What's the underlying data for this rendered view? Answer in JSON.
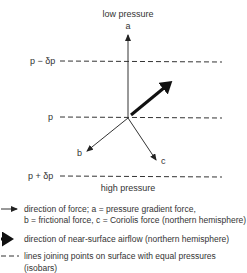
{
  "diagram": {
    "top_label": "low pressure",
    "bottom_label": "high pressure",
    "isobars": [
      {
        "label": "p − δp",
        "y": 61
      },
      {
        "label": "p",
        "y": 117
      },
      {
        "label": "p + δp",
        "y": 176
      }
    ],
    "forces": {
      "a": {
        "label": "a",
        "name": "pressure gradient force"
      },
      "b": {
        "label": "b",
        "name": "frictional force"
      },
      "c": {
        "label": "c",
        "name": "Coriolis force (northern hemisphere)"
      }
    },
    "airflow": {
      "name": "near-surface airflow (northern hemisphere)"
    },
    "colors": {
      "line": "#222222",
      "background": "#ffffff"
    }
  },
  "legend": {
    "force_line1": "direction of force; a = pressure gradient force,",
    "force_line2": "b = frictional force, c = Coriolis force (northern hemisphere)",
    "airflow": "direction of near-surface airflow (northern hemisphere)",
    "isobar_line1": "lines joining points on surface with equal pressures",
    "isobar_line2": "(isobars)"
  }
}
